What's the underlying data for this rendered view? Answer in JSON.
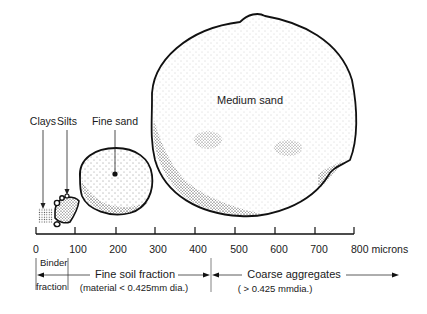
{
  "labels": {
    "clays": "Clays",
    "silts": "Silts",
    "fine_sand": "Fine sand",
    "medium_sand": "Medium sand"
  },
  "axis": {
    "unit": "microns",
    "ticks": [
      {
        "value": "0",
        "x": 36
      },
      {
        "value": "100",
        "x": 75
      },
      {
        "value": "200",
        "x": 116
      },
      {
        "value": "300",
        "x": 155
      },
      {
        "value": "400",
        "x": 195
      },
      {
        "value": "500",
        "x": 235
      },
      {
        "value": "600",
        "x": 275
      },
      {
        "value": "700",
        "x": 315
      },
      {
        "value": "800 microns",
        "x": 354
      }
    ]
  },
  "fractions": {
    "binder_line1": "Binder",
    "binder_line2": "fraction",
    "fine_soil": "Fine soil fraction",
    "fine_soil_sub": "(material < 0.425mm dia.)",
    "coarse": "Coarse aggregates",
    "coarse_sub": "( > 0.425 mmdia.)"
  },
  "colors": {
    "ink": "#111111",
    "background": "#ffffff"
  }
}
